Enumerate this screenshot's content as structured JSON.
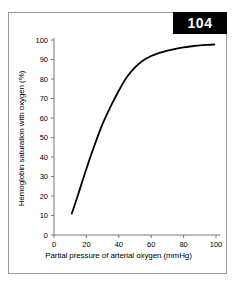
{
  "figure": {
    "badge_label": "104",
    "badge_color": "#000000",
    "badge_text_color": "#ffffff",
    "frame_color": "#9a9a9a",
    "background_color": "#ffffff"
  },
  "chart_data": {
    "type": "line",
    "title": "",
    "subtitle": "",
    "xlabel": "Partial pressure of arterial oxygen (mmHg)",
    "ylabel": "Hemoglobin saturation with oxygen (%)",
    "xlim": [
      0,
      100
    ],
    "ylim": [
      0,
      100
    ],
    "xticks": [
      0,
      20,
      40,
      60,
      80,
      100
    ],
    "xtick_labels": [
      "0",
      "20",
      "40",
      "60",
      "80",
      "100"
    ],
    "yticks": [
      0,
      10,
      20,
      30,
      40,
      50,
      60,
      70,
      80,
      90,
      100
    ],
    "ytick_labels": [
      "0",
      "10",
      "20",
      "30",
      "40",
      "50",
      "60",
      "70",
      "80",
      "90",
      "100"
    ],
    "grid": false,
    "legend": false,
    "legend_position": "none",
    "line_color": "#000000",
    "line_width": 1.8,
    "series": [
      {
        "name": "Oxygen-hemoglobin dissociation curve",
        "x": [
          11,
          15,
          20,
          25,
          30,
          35,
          40,
          45,
          50,
          55,
          60,
          65,
          70,
          75,
          80,
          85,
          90,
          95,
          99
        ],
        "y": [
          11,
          21,
          34,
          46,
          57,
          66,
          74,
          81,
          86,
          89.5,
          91.8,
          93.4,
          94.6,
          95.5,
          96.2,
          96.8,
          97.2,
          97.5,
          97.7
        ]
      }
    ],
    "annotations": []
  }
}
